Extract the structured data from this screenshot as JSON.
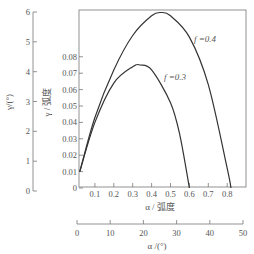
{
  "chart_data": {
    "type": "line",
    "title": "",
    "xlabel": "α / 弧度",
    "ylabel": "γ / 弧度",
    "secondary_xlabel": "α /(°)",
    "secondary_ylabel": "γ/(°)",
    "xlim": [
      0,
      0.9
    ],
    "ylim": [
      0,
      0.08
    ],
    "x_ticks": [
      "0.1",
      "0.2",
      "0.3",
      "0.4",
      "0.5",
      "0.6",
      "0.7",
      "0.8"
    ],
    "y_ticks": [
      "0",
      "0.01",
      "0.02",
      "0.03",
      "0.04",
      "0.05",
      "0.06",
      "0.07",
      "0.08"
    ],
    "secondary_x_ticks": [
      "0",
      "10",
      "20",
      "30",
      "40",
      "50"
    ],
    "secondary_y_ticks": [
      "0",
      "1",
      "2",
      "3",
      "4",
      "5",
      "6"
    ],
    "grid": false,
    "series": [
      {
        "name": "f=0.4",
        "label": "f =0.4",
        "x": [
          0.02,
          0.1,
          0.2,
          0.3,
          0.4,
          0.45,
          0.5,
          0.6,
          0.7,
          0.8,
          0.82
        ],
        "y": [
          0.01,
          0.043,
          0.072,
          0.093,
          0.105,
          0.107,
          0.105,
          0.092,
          0.063,
          0.012,
          0.0
        ]
      },
      {
        "name": "f=0.3",
        "label": "f =0.3",
        "x": [
          0.02,
          0.1,
          0.2,
          0.3,
          0.34,
          0.4,
          0.5,
          0.55,
          0.6
        ],
        "y": [
          0.01,
          0.04,
          0.064,
          0.074,
          0.075,
          0.072,
          0.052,
          0.032,
          0.0
        ]
      }
    ]
  }
}
